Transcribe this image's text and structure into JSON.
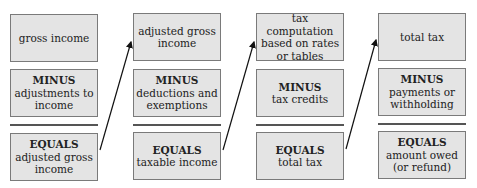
{
  "columns": [
    {
      "top": {
        "lines": [
          "gross income"
        ]
      },
      "middle": {
        "keyword": "MINUS",
        "lines": [
          "adjustments to",
          "income"
        ]
      },
      "bottom": {
        "keyword": "EQUALS",
        "lines": [
          "adjusted gross",
          "income"
        ]
      }
    },
    {
      "top": {
        "lines": [
          "adjusted gross",
          "income"
        ]
      },
      "middle": {
        "keyword": "MINUS",
        "lines": [
          "deductions and",
          "exemptions"
        ]
      },
      "bottom": {
        "keyword": "EQUALS",
        "lines": [
          "taxable income"
        ]
      }
    },
    {
      "top": {
        "lines": [
          "tax computation",
          "based on rates",
          "or tables"
        ]
      },
      "middle": {
        "keyword": "MINUS",
        "lines": [
          "tax credits"
        ]
      },
      "bottom": {
        "keyword": "EQUALS",
        "lines": [
          "total tax"
        ]
      }
    },
    {
      "top": {
        "lines": [
          "total tax"
        ]
      },
      "middle": {
        "keyword": "MINUS",
        "lines": [
          "payments or",
          "withholding"
        ]
      },
      "bottom": {
        "keyword": "EQUALS",
        "lines": [
          "amount owed",
          "(or refund)"
        ]
      }
    }
  ],
  "colors": {
    "box_fill": "#e4e4e4",
    "box_border": "#7a7a7a",
    "rule": "#555555",
    "arrow": "#111111"
  }
}
